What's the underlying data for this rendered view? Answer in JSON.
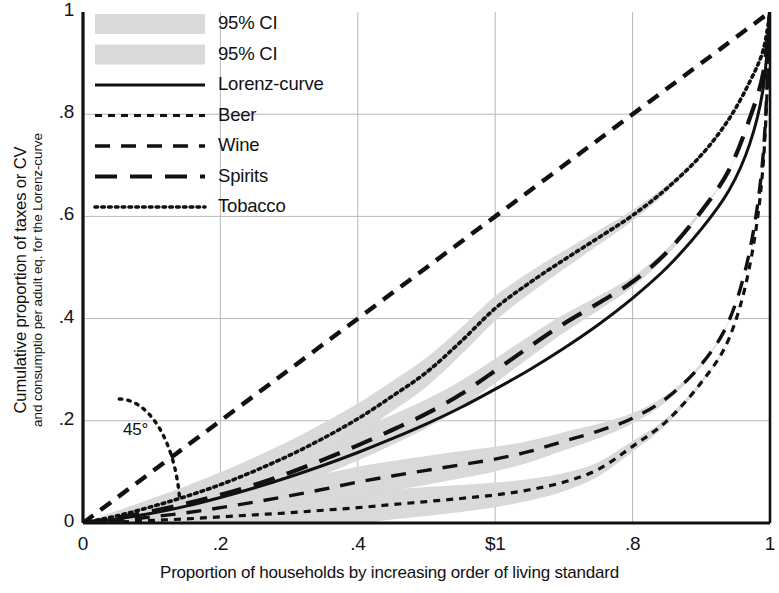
{
  "chart_data": {
    "type": "line",
    "title": "",
    "xlabel": "Proportion of households by increasing order of living standard",
    "ylabel_line1": "Cumulative proportion of taxes or CV",
    "ylabel_line2": "and consumptio per adult eq. for the Lorenz-curve",
    "xlim": [
      0,
      1
    ],
    "ylim": [
      0,
      1
    ],
    "xticks": [
      0,
      0.2,
      0.4,
      0.6,
      0.8,
      1
    ],
    "xticklabels": [
      "0",
      ".2",
      ".4",
      "$1",
      ".8",
      "1"
    ],
    "yticks": [
      0,
      0.2,
      0.4,
      0.6,
      0.8,
      1
    ],
    "yticklabels": [
      "0",
      ".2",
      ".4",
      ".6",
      ".8",
      "1"
    ],
    "grid": true,
    "grid_color": "#b9b9b9",
    "legend_position": "upper-left",
    "annotations": [
      {
        "text": "45°",
        "x": 0.07,
        "y": 0.175,
        "note": "angle arc marking the 45 degree equality diagonal"
      }
    ],
    "ci_band_color": "#d9d9d9",
    "line_color": "#111111",
    "series": [
      {
        "name": "Equality diagonal",
        "style": "dashed",
        "legend": false,
        "x": [
          0,
          1
        ],
        "values": [
          0,
          1
        ]
      },
      {
        "name": "Lorenz-curve",
        "style": "solid",
        "ci": false,
        "x": [
          0,
          0.05,
          0.1,
          0.15,
          0.2,
          0.25,
          0.3,
          0.35,
          0.4,
          0.45,
          0.5,
          0.55,
          0.6,
          0.65,
          0.7,
          0.75,
          0.8,
          0.85,
          0.9,
          0.94,
          0.97,
          0.99,
          1.0
        ],
        "values": [
          0,
          0.008,
          0.019,
          0.033,
          0.05,
          0.069,
          0.09,
          0.113,
          0.138,
          0.165,
          0.194,
          0.226,
          0.262,
          0.3,
          0.342,
          0.388,
          0.44,
          0.5,
          0.575,
          0.65,
          0.74,
          0.85,
          1.0
        ]
      },
      {
        "name": "Beer",
        "style": "short-dash",
        "ci": true,
        "x": [
          0,
          0.05,
          0.1,
          0.15,
          0.2,
          0.25,
          0.3,
          0.35,
          0.4,
          0.45,
          0.5,
          0.55,
          0.6,
          0.65,
          0.7,
          0.75,
          0.8,
          0.85,
          0.9,
          0.94,
          0.97,
          0.99,
          1.0
        ],
        "values": [
          0,
          0.002,
          0.005,
          0.008,
          0.012,
          0.016,
          0.02,
          0.025,
          0.03,
          0.036,
          0.042,
          0.048,
          0.055,
          0.065,
          0.08,
          0.105,
          0.15,
          0.2,
          0.275,
          0.36,
          0.5,
          0.7,
          1.0
        ]
      },
      {
        "name": "Wine",
        "style": "medium-dash",
        "ci": true,
        "x": [
          0,
          0.05,
          0.1,
          0.15,
          0.2,
          0.25,
          0.3,
          0.35,
          0.4,
          0.45,
          0.5,
          0.55,
          0.6,
          0.65,
          0.7,
          0.75,
          0.8,
          0.85,
          0.9,
          0.94,
          0.97,
          0.99,
          1.0
        ],
        "values": [
          0,
          0.005,
          0.012,
          0.02,
          0.03,
          0.041,
          0.053,
          0.066,
          0.08,
          0.092,
          0.103,
          0.114,
          0.125,
          0.14,
          0.16,
          0.18,
          0.205,
          0.245,
          0.31,
          0.395,
          0.53,
          0.72,
          1.0
        ]
      },
      {
        "name": "Spirits",
        "style": "long-dash",
        "ci": true,
        "x": [
          0,
          0.05,
          0.1,
          0.15,
          0.2,
          0.25,
          0.3,
          0.35,
          0.4,
          0.45,
          0.5,
          0.55,
          0.6,
          0.65,
          0.7,
          0.75,
          0.8,
          0.85,
          0.9,
          0.94,
          0.97,
          0.99,
          1.0
        ],
        "values": [
          0,
          0.01,
          0.023,
          0.038,
          0.055,
          0.075,
          0.098,
          0.124,
          0.152,
          0.182,
          0.214,
          0.252,
          0.298,
          0.345,
          0.39,
          0.43,
          0.472,
          0.53,
          0.61,
          0.69,
          0.79,
          0.88,
          1.0
        ]
      },
      {
        "name": "Tobacco",
        "style": "dotted",
        "ci": true,
        "x": [
          0,
          0.05,
          0.1,
          0.15,
          0.2,
          0.25,
          0.3,
          0.35,
          0.4,
          0.45,
          0.5,
          0.55,
          0.6,
          0.65,
          0.7,
          0.75,
          0.8,
          0.85,
          0.9,
          0.94,
          0.97,
          0.99,
          1.0
        ],
        "values": [
          0,
          0.014,
          0.032,
          0.052,
          0.075,
          0.102,
          0.132,
          0.166,
          0.204,
          0.248,
          0.295,
          0.355,
          0.42,
          0.47,
          0.515,
          0.558,
          0.602,
          0.655,
          0.72,
          0.79,
          0.862,
          0.925,
          1.0
        ]
      }
    ]
  },
  "legend": {
    "items": [
      {
        "label": "95% CI",
        "style": "band"
      },
      {
        "label": "95% CI",
        "style": "band"
      },
      {
        "label": "Lorenz-curve",
        "style": "solid"
      },
      {
        "label": "Beer",
        "style": "short-dash"
      },
      {
        "label": "Wine",
        "style": "medium-dash"
      },
      {
        "label": "Spirits",
        "style": "long-dash"
      },
      {
        "label": "Tobacco",
        "style": "dotted"
      }
    ]
  }
}
